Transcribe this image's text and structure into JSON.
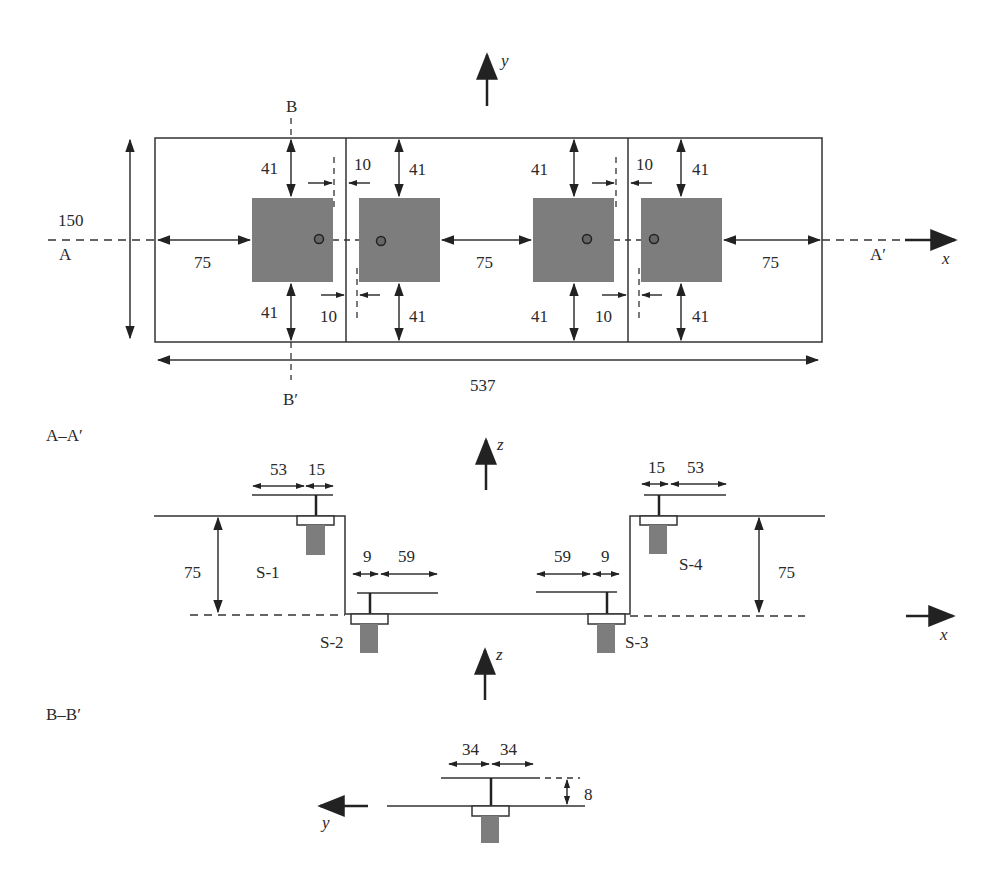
{
  "diagram": {
    "plan_view": {
      "axis_y_label": "y",
      "axis_x_label": "x",
      "section_b_top": "B",
      "section_b_bottom": "B′",
      "section_a_left": "A",
      "section_a_right": "A′",
      "height_dim": "150",
      "total_length_dim": "537",
      "edge_dims": [
        "75",
        "75",
        "75"
      ],
      "top_dims": [
        "41",
        "41",
        "41",
        "41"
      ],
      "bottom_dims": [
        "41",
        "41",
        "41",
        "41"
      ],
      "gap_dims_top": [
        "10",
        "10"
      ],
      "gap_dims_bottom": [
        "10",
        "10"
      ]
    },
    "section_aa": {
      "title": "A–A′",
      "axis_z_label": "z",
      "axis_x_label": "x",
      "left_height_dim": "75",
      "right_height_dim": "75",
      "s1_dims": [
        "53",
        "15"
      ],
      "s2_dims": [
        "9",
        "59"
      ],
      "s3_dims": [
        "59",
        "9"
      ],
      "s4_dims": [
        "15",
        "53"
      ],
      "supports": [
        "S-1",
        "S-2",
        "S-3",
        "S-4"
      ]
    },
    "section_bb": {
      "title": "B–B′",
      "axis_z_label": "z",
      "axis_y_label": "y",
      "width_dims": [
        "34",
        "34"
      ],
      "offset_dim": "8"
    }
  }
}
